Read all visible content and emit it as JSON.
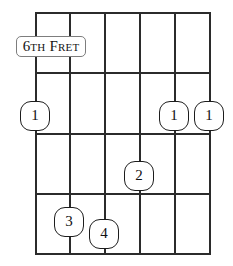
{
  "diagram": {
    "type": "guitar-chord-diagram",
    "title": "",
    "background_color": "#ffffff",
    "line_color": "#2b2b2b",
    "marker_outline_color": "#1d1d1d",
    "marker_fill_color": "#ffffff",
    "label_border_color": "#7d7d7d"
  },
  "fret_label": {
    "full_text": "6TH FRET",
    "lead_number": "6",
    "ordinal_suffix": "TH",
    "word_lead": "F",
    "word_rest": "RET",
    "x": 16,
    "y": 36,
    "width": 70,
    "height": 21
  },
  "fretboard": {
    "string_count": 6,
    "fret_count": 4,
    "strings_x": [
      35,
      69,
      104,
      139,
      174,
      209
    ],
    "frets_y": [
      12,
      72,
      133,
      193,
      253
    ]
  },
  "markers": [
    {
      "label": "1",
      "string_index": 0,
      "x": 35,
      "y": 116
    },
    {
      "label": "1",
      "string_index": 4,
      "x": 174,
      "y": 116
    },
    {
      "label": "1",
      "string_index": 5,
      "x": 209,
      "y": 116
    },
    {
      "label": "2",
      "string_index": 3,
      "x": 139,
      "y": 176
    },
    {
      "label": "3",
      "string_index": 1,
      "x": 69,
      "y": 222
    },
    {
      "label": "4",
      "string_index": 2,
      "x": 104,
      "y": 234
    }
  ]
}
